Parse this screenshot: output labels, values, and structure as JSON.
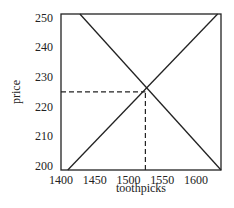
{
  "chart_data": {
    "type": "line",
    "title": "",
    "xlabel": "toothpicks",
    "ylabel": "price",
    "xlim": [
      1400,
      1637
    ],
    "ylim": [
      198.6,
      251.3
    ],
    "x_ticks": [
      1400,
      1450,
      1500,
      1550,
      1600
    ],
    "y_ticks": [
      200,
      210,
      220,
      230,
      240,
      250
    ],
    "x_tick_labels": [
      "1400",
      "1450",
      "1500",
      "1550",
      "1600"
    ],
    "y_tick_labels": [
      "200",
      "210",
      "220",
      "230",
      "240",
      "250"
    ],
    "grid": false,
    "legend": null,
    "series": [
      {
        "name": "supply",
        "style": "solid",
        "color": "#222222",
        "x": [
          1410,
          1632
        ],
        "y": [
          198.6,
          251.3
        ]
      },
      {
        "name": "demand",
        "style": "solid",
        "color": "#222222",
        "x": [
          1428,
          1637
        ],
        "y": [
          251.3,
          198.6
        ]
      }
    ],
    "annotations": [
      {
        "type": "dashed-hline",
        "y": 225,
        "x_from": 1400,
        "x_to": 1525
      },
      {
        "type": "dashed-vline",
        "x": 1525,
        "y_from": 198.6,
        "y_to": 225
      }
    ],
    "equilibrium": {
      "x": 1525,
      "y": 225
    }
  }
}
